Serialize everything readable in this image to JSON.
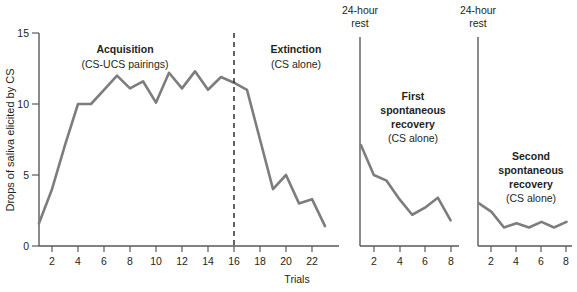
{
  "chart_data": {
    "type": "line",
    "title": "",
    "xlabel": "Trials",
    "ylabel": "Drops of saliva elicited by CS",
    "ylim": [
      0,
      15
    ],
    "yticks": [
      0,
      5,
      10,
      15
    ],
    "yticklabels": [
      "0",
      "5",
      "10",
      "15"
    ],
    "grid": false,
    "legend": "none",
    "line_color": "#7d7d7d",
    "axis_color": "#58595b",
    "text_color": "#231f20",
    "panels": [
      {
        "name": "acquisition-extinction",
        "xlim": [
          1,
          23
        ],
        "xticks": [
          2,
          4,
          6,
          8,
          10,
          12,
          14,
          16,
          18,
          20,
          22
        ],
        "xticklabels": [
          "2",
          "4",
          "6",
          "8",
          "10",
          "12",
          "14",
          "16",
          "18",
          "20",
          "22"
        ],
        "x": [
          1,
          2,
          3,
          4,
          5,
          6,
          7,
          8,
          9,
          10,
          11,
          12,
          13,
          14,
          15,
          16,
          17,
          18,
          19,
          20,
          21,
          22,
          23
        ],
        "y": [
          1.6,
          4.0,
          7.1,
          10.0,
          10.0,
          11.0,
          12.0,
          11.1,
          11.6,
          10.1,
          12.2,
          11.1,
          12.3,
          11.0,
          11.9,
          11.5,
          11.0,
          7.5,
          4.0,
          5.0,
          3.0,
          3.3,
          1.4
        ],
        "annotations": [
          {
            "id": "acquisition",
            "bold": "Acquisition",
            "plain": "(CS-UCS pairings)"
          },
          {
            "id": "extinction",
            "bold": "Extinction",
            "plain": "(CS alone)"
          }
        ],
        "divider_at_x": 16
      },
      {
        "name": "first-spontaneous-recovery",
        "rest_label_line1": "24-hour",
        "rest_label_line2": "rest",
        "xlim": [
          1,
          8
        ],
        "xticks": [
          2,
          4,
          6,
          8
        ],
        "xticklabels": [
          "2",
          "4",
          "6",
          "8"
        ],
        "x": [
          1,
          2,
          3,
          4,
          5,
          6,
          7,
          8
        ],
        "y": [
          7.1,
          5.0,
          4.6,
          3.3,
          2.2,
          2.7,
          3.4,
          1.8
        ],
        "annotations": [
          {
            "id": "first-recovery",
            "bold_line1": "First",
            "bold_line2": "spontaneous",
            "bold_line3": "recovery",
            "plain": "(CS alone)"
          }
        ]
      },
      {
        "name": "second-spontaneous-recovery",
        "rest_label_line1": "24-hour",
        "rest_label_line2": "rest",
        "xlim": [
          1,
          8
        ],
        "xticks": [
          2,
          4,
          6,
          8
        ],
        "xticklabels": [
          "2",
          "4",
          "6",
          "8"
        ],
        "x": [
          1,
          2,
          3,
          4,
          5,
          6,
          7,
          8
        ],
        "y": [
          3.0,
          2.4,
          1.3,
          1.6,
          1.3,
          1.7,
          1.3,
          1.7
        ],
        "annotations": [
          {
            "id": "second-recovery",
            "bold_line1": "Second",
            "bold_line2": "spontaneous",
            "bold_line3": "recovery",
            "plain": "(CS alone)"
          }
        ]
      }
    ]
  },
  "axes": {
    "y_title": "Drops of saliva elicited by CS",
    "x_title": "Trials",
    "y_tick_15": "15",
    "y_tick_10": "10",
    "y_tick_5": "5",
    "y_tick_0": "0"
  },
  "panel1": {
    "xt_2": "2",
    "xt_4": "4",
    "xt_6": "6",
    "xt_8": "8",
    "xt_10": "10",
    "xt_12": "12",
    "xt_14": "14",
    "xt_16": "16",
    "xt_18": "18",
    "xt_20": "20",
    "xt_22": "22",
    "acquisition_bold": "Acquisition",
    "acquisition_plain": "(CS-UCS pairings)",
    "extinction_bold": "Extinction",
    "extinction_plain": "(CS alone)"
  },
  "panel2": {
    "rest_l1": "24-hour",
    "rest_l2": "rest",
    "xt_2": "2",
    "xt_4": "4",
    "xt_6": "6",
    "xt_8": "8",
    "title_l1": "First",
    "title_l2": "spontaneous",
    "title_l3": "recovery",
    "subtitle": "(CS alone)"
  },
  "panel3": {
    "rest_l1": "24-hour",
    "rest_l2": "rest",
    "xt_2": "2",
    "xt_4": "4",
    "xt_6": "6",
    "xt_8": "8",
    "title_l1": "Second",
    "title_l2": "spontaneous",
    "title_l3": "recovery",
    "subtitle": "(CS alone)"
  }
}
